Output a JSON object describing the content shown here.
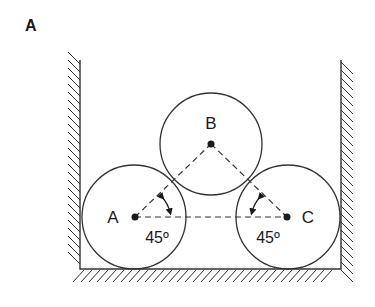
{
  "figure": {
    "panel_label": "A",
    "colors": {
      "stroke": "#333333",
      "ink": "#1a1a1a",
      "background": "#ffffff"
    },
    "container": {
      "left_wall_x": 80,
      "right_wall_x": 341,
      "floor_y": 269,
      "wall_top_y": 60
    },
    "circles": [
      {
        "id": "A",
        "label": "A",
        "cx": 135,
        "cy": 217,
        "r": 52,
        "label_x": 113,
        "label_y": 223
      },
      {
        "id": "B",
        "label": "B",
        "cx": 211,
        "cy": 144,
        "r": 51,
        "label_x": 211,
        "label_y": 129
      },
      {
        "id": "C",
        "label": "C",
        "cx": 287,
        "cy": 217,
        "r": 52,
        "label_x": 307,
        "label_y": 223
      }
    ],
    "angles": [
      {
        "vertex": "A",
        "label": "45º",
        "label_x": 157,
        "label_y": 243
      },
      {
        "vertex": "C",
        "label": "45º",
        "label_x": 268,
        "label_y": 243
      }
    ]
  }
}
